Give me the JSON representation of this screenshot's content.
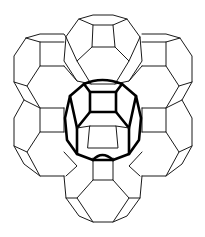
{
  "figure": {
    "colors": {
      "background": "#ffffff",
      "line": "#1a1a1a",
      "highlight": "#000000"
    },
    "cages": [
      {
        "id": "top",
        "cx": 102,
        "cy": 48
      },
      {
        "id": "upper-left",
        "cx": 38,
        "cy": 62
      },
      {
        "id": "upper-right",
        "cx": 166,
        "cy": 62
      },
      {
        "id": "lower-left",
        "cx": 38,
        "cy": 148
      },
      {
        "id": "lower-right",
        "cx": 166,
        "cy": 148
      },
      {
        "id": "bottom",
        "cx": 102,
        "cy": 190
      },
      {
        "id": "center-highlighted",
        "cx": 102,
        "cy": 120
      }
    ]
  }
}
